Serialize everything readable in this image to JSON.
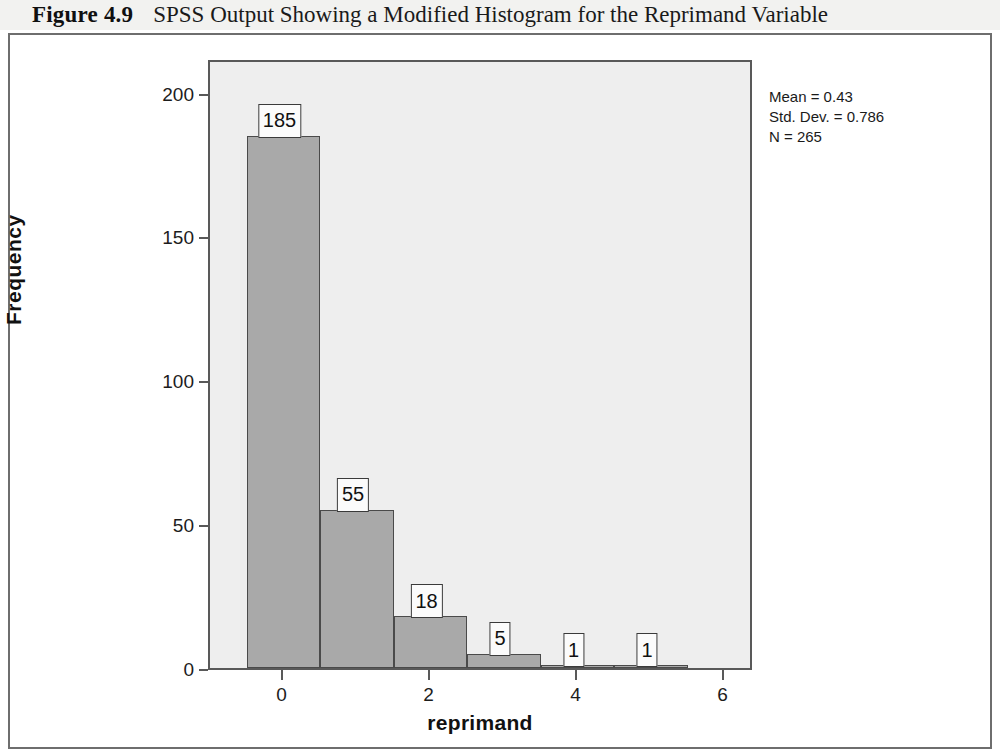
{
  "caption": {
    "figure_number": "Figure 4.9",
    "title": "SPSS Output Showing a Modified Histogram for the Reprimand Variable"
  },
  "statistics": {
    "mean": "Mean = 0.43",
    "std_dev": "Std. Dev. = 0.786",
    "n": "N = 265"
  },
  "chart_data": {
    "type": "bar",
    "title": "",
    "subtitle": "",
    "xlabel": "reprimand",
    "ylabel": "Frequency",
    "categories": [
      0,
      1,
      2,
      3,
      4,
      5
    ],
    "values": [
      185,
      55,
      18,
      5,
      1,
      1
    ],
    "data_labels": [
      "185",
      "55",
      "18",
      "5",
      "1",
      "1"
    ],
    "bin_width": 1,
    "xlim": [
      -1,
      6.4
    ],
    "ylim": [
      0,
      212
    ],
    "x_ticks": [
      0,
      2,
      4,
      6
    ],
    "x_tick_labels": [
      "0",
      "2",
      "4",
      "6"
    ],
    "y_ticks": [
      0,
      50,
      100,
      150,
      200
    ],
    "y_tick_labels": [
      "0",
      "50",
      "100",
      "150",
      "200"
    ],
    "grid": false,
    "legend": false,
    "legend_position": "none",
    "annotations": [
      "Mean = 0.43",
      "Std. Dev. = 0.786",
      "N = 265"
    ],
    "colors": {
      "bar_fill": "#a9a9a9",
      "bar_border": "#4a4a4a",
      "plot_background": "#eeeeee",
      "axis": "#595959",
      "label_background": "#fbfbfb",
      "text": "#111111"
    }
  }
}
